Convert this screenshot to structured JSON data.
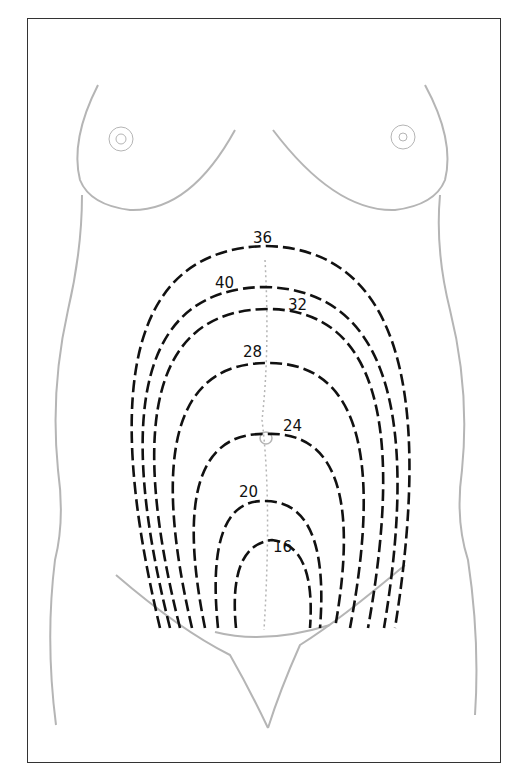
{
  "figure": {
    "type": "anatomical illustration",
    "labels": [
      {
        "text": "36",
        "x": 264,
        "y": 245
      },
      {
        "text": "40",
        "x": 226,
        "y": 288
      },
      {
        "text": "32",
        "x": 298,
        "y": 310
      },
      {
        "text": "28",
        "x": 253,
        "y": 358
      },
      {
        "text": "24",
        "x": 285,
        "y": 435
      },
      {
        "text": "20",
        "x": 230,
        "y": 500
      },
      {
        "text": "16",
        "x": 281,
        "y": 555
      }
    ]
  },
  "colors": {
    "contour": "#111111",
    "anatomy": "#b5b5b5",
    "frame": "#333333",
    "background": "#ffffff"
  }
}
